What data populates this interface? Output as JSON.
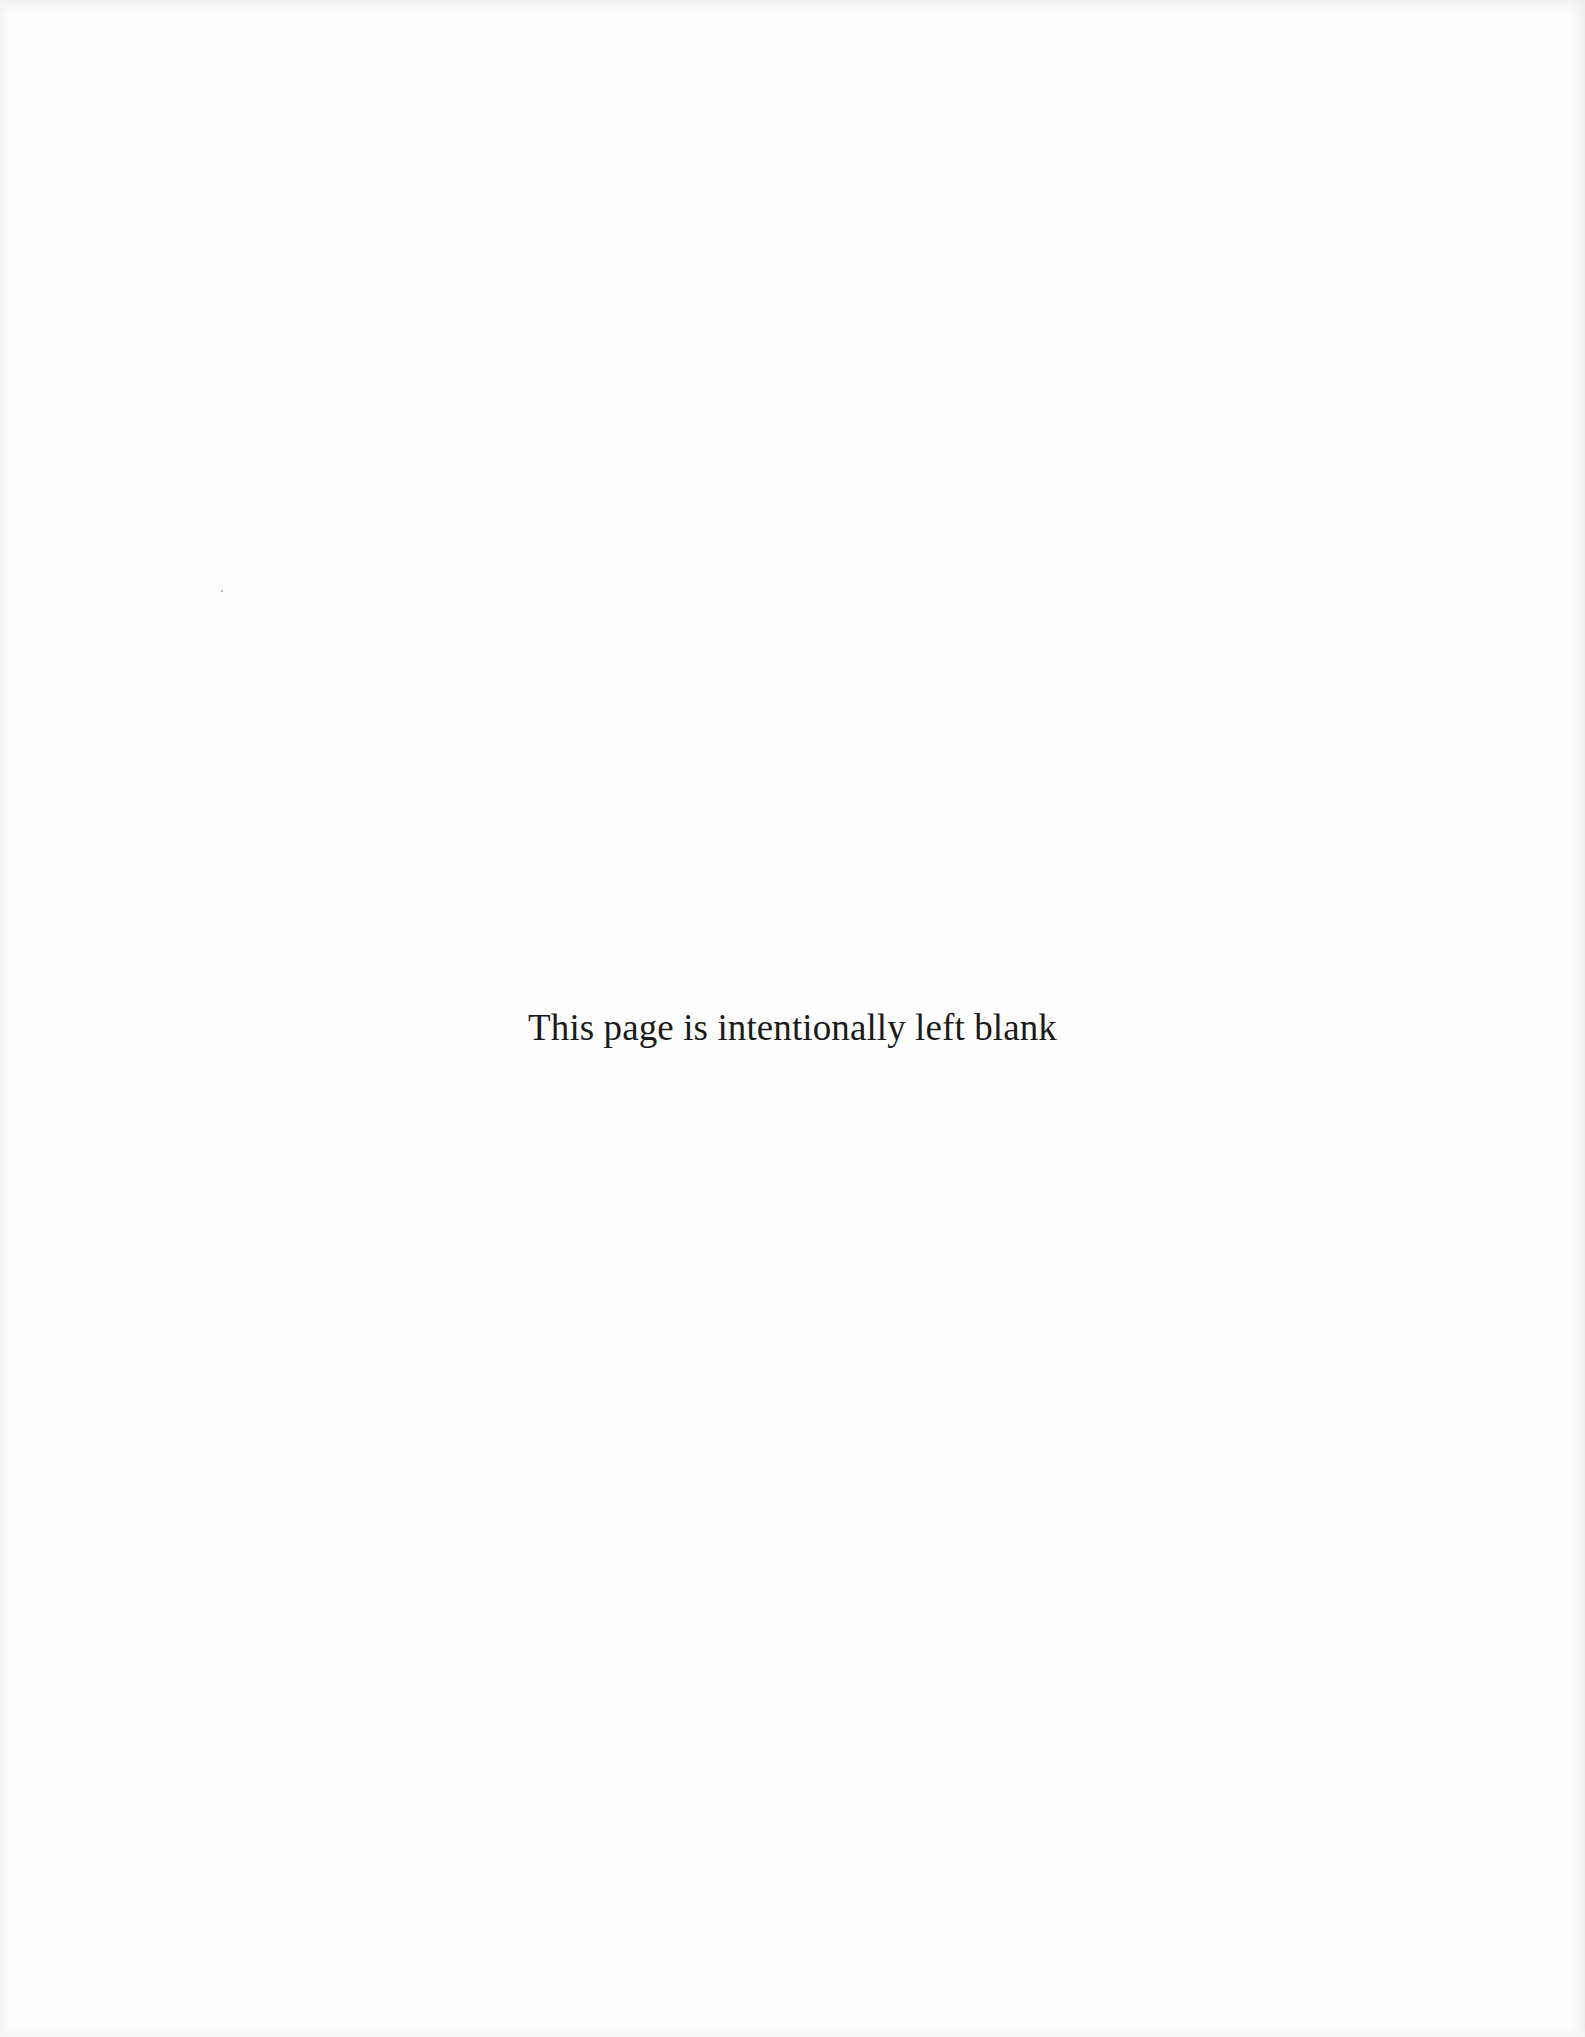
{
  "page": {
    "notice_text": "This page is intentionally left blank",
    "background_color": "#fefefe",
    "text_color": "#1a1a1a"
  }
}
